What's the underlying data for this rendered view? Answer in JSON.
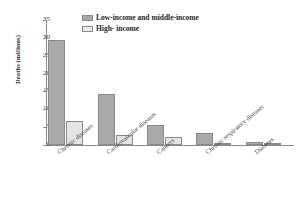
{
  "chart_data": {
    "type": "bar",
    "title": "",
    "xlabel": "",
    "ylabel": "Deaths (millions)",
    "ylim": [
      0,
      35
    ],
    "yticks": [
      "0",
      "5",
      "10",
      "15",
      "20",
      "25",
      "30",
      "35"
    ],
    "grid": false,
    "legend_position": "top-center",
    "categories": [
      "Chronic diseases",
      "Cardiovascular diseases",
      "Cancers",
      "Chronic respiratory diseases",
      "Diabetes"
    ],
    "series": [
      {
        "name": "Low-income and middle-income",
        "color": "#a9a9a9",
        "values": [
          29.3,
          14.3,
          5.6,
          3.5,
          0.9
        ]
      },
      {
        "name": "High- income",
        "color": "#e4e4e4",
        "values": [
          6.7,
          2.9,
          2.2,
          0.3,
          0.3
        ]
      }
    ]
  },
  "legend": {
    "items": [
      {
        "label": "Low-income and middle-income"
      },
      {
        "label": "High- income"
      }
    ]
  },
  "axis": {
    "y_title": "Deaths (millions)"
  }
}
